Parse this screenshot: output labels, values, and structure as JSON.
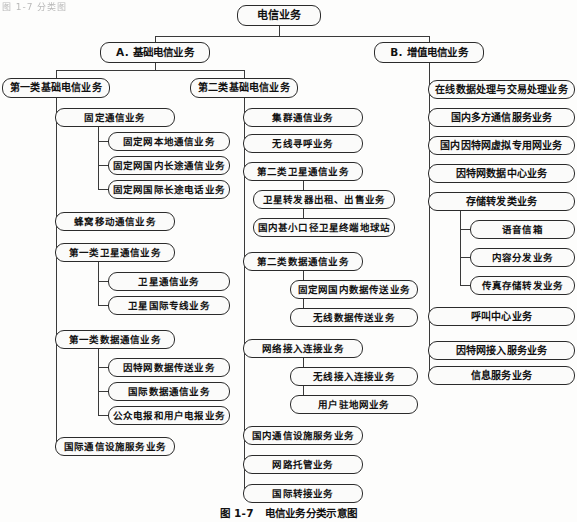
{
  "figure": {
    "caption_number": "图 1-7",
    "caption_title": "电信业务分类示意图",
    "top_cut_text": "图 1-7  分类图",
    "line_color": "#3a3a3a",
    "box_border_color": "#2b2b2b",
    "box_fill_color": "#fbfbfa",
    "text_color": "#111111"
  },
  "nodes": {
    "root": {
      "label": "电信业务",
      "x": 237,
      "y": 5,
      "w": 84,
      "h": 21,
      "level": 0
    },
    "a_basic": {
      "label": "A. 基础电信业务",
      "x": 100,
      "y": 42,
      "w": 110,
      "h": 21,
      "level": 1
    },
    "b_value": {
      "label": "B. 增值电信业务",
      "x": 374,
      "y": 42,
      "w": 110,
      "h": 21,
      "level": 1
    },
    "a1": {
      "label": "第一类基础电信业务",
      "x": 2,
      "y": 78,
      "w": 108,
      "h": 20,
      "level": 2
    },
    "a2": {
      "label": "第二类基础电信业务",
      "x": 190,
      "y": 78,
      "w": 108,
      "h": 20,
      "level": 2
    },
    "a1_1": {
      "label": "固定通信业务",
      "x": 55,
      "y": 108,
      "w": 120,
      "h": 19,
      "level": 3
    },
    "a1_1_1": {
      "label": "固定网本地通信业务",
      "x": 108,
      "y": 132,
      "w": 122,
      "h": 19,
      "level": 4
    },
    "a1_1_2": {
      "label": "固定网国内长途通信业务",
      "x": 108,
      "y": 156,
      "w": 122,
      "h": 19,
      "level": 4
    },
    "a1_1_3": {
      "label": "固定网国际长途电话业务",
      "x": 108,
      "y": 180,
      "w": 122,
      "h": 19,
      "level": 4
    },
    "a1_2": {
      "label": "蜂窝移动通信业务",
      "x": 55,
      "y": 212,
      "w": 120,
      "h": 19,
      "level": 3
    },
    "a1_3": {
      "label": "第一类卫星通信业务",
      "x": 55,
      "y": 243,
      "w": 120,
      "h": 19,
      "level": 3
    },
    "a1_3_1": {
      "label": "卫星通信业务",
      "x": 108,
      "y": 272,
      "w": 122,
      "h": 19,
      "level": 4
    },
    "a1_3_2": {
      "label": "卫星国际专线业务",
      "x": 108,
      "y": 296,
      "w": 122,
      "h": 19,
      "level": 4
    },
    "a1_4": {
      "label": "第一类数据通信业务",
      "x": 55,
      "y": 330,
      "w": 120,
      "h": 19,
      "level": 3
    },
    "a1_4_1": {
      "label": "因特网数据传送业务",
      "x": 108,
      "y": 358,
      "w": 122,
      "h": 19,
      "level": 4
    },
    "a1_4_2": {
      "label": "国际数据通信业务",
      "x": 108,
      "y": 382,
      "w": 122,
      "h": 19,
      "level": 4
    },
    "a1_4_3": {
      "label": "公众电报和用户电报业务",
      "x": 108,
      "y": 406,
      "w": 122,
      "h": 19,
      "level": 4
    },
    "a1_5": {
      "label": "国际通信设施服务业务",
      "x": 55,
      "y": 437,
      "w": 120,
      "h": 19,
      "level": 3
    },
    "a2_1": {
      "label": "集群通信业务",
      "x": 243,
      "y": 108,
      "w": 120,
      "h": 19,
      "level": 3
    },
    "a2_2": {
      "label": "无线寻呼业务",
      "x": 243,
      "y": 134,
      "w": 120,
      "h": 19,
      "level": 3
    },
    "a2_3": {
      "label": "第二类卫星通信业务",
      "x": 243,
      "y": 162,
      "w": 120,
      "h": 19,
      "level": 3
    },
    "a2_3_1": {
      "label": "卫星转发器出租、出售业务",
      "x": 253,
      "y": 190,
      "w": 142,
      "h": 19,
      "level": 4
    },
    "a2_3_2": {
      "label": "国内甚小口径卫星终端地球站",
      "x": 253,
      "y": 218,
      "w": 142,
      "h": 19,
      "level": 4
    },
    "a2_4": {
      "label": "第二类数据通信业务",
      "x": 243,
      "y": 252,
      "w": 120,
      "h": 19,
      "level": 3
    },
    "a2_4_1": {
      "label": "固定网国内数据传送业务",
      "x": 290,
      "y": 280,
      "w": 128,
      "h": 19,
      "level": 4
    },
    "a2_4_2": {
      "label": "无线数据传送业务",
      "x": 290,
      "y": 308,
      "w": 128,
      "h": 19,
      "level": 4
    },
    "a2_5": {
      "label": "网络接入连接业务",
      "x": 243,
      "y": 339,
      "w": 120,
      "h": 19,
      "level": 3
    },
    "a2_5_1": {
      "label": "无线接入连接业务",
      "x": 290,
      "y": 367,
      "w": 128,
      "h": 19,
      "level": 4
    },
    "a2_5_2": {
      "label": "用户驻地网业务",
      "x": 290,
      "y": 395,
      "w": 128,
      "h": 19,
      "level": 4
    },
    "a2_6": {
      "label": "国内通信设施服务业务",
      "x": 243,
      "y": 426,
      "w": 120,
      "h": 19,
      "level": 3
    },
    "a2_7": {
      "label": "网路托管业务",
      "x": 243,
      "y": 455,
      "w": 120,
      "h": 19,
      "level": 3
    },
    "a2_8": {
      "label": "国际转接业务",
      "x": 243,
      "y": 484,
      "w": 120,
      "h": 19,
      "level": 3
    },
    "b1": {
      "label": "在线数据处理与交易处理业务",
      "x": 428,
      "y": 80,
      "w": 147,
      "h": 19,
      "level": 2
    },
    "b2": {
      "label": "国内多方通信服务业务",
      "x": 428,
      "y": 108,
      "w": 147,
      "h": 19,
      "level": 2
    },
    "b3": {
      "label": "国内因特网虚拟专用网业务",
      "x": 428,
      "y": 136,
      "w": 147,
      "h": 19,
      "level": 2
    },
    "b4": {
      "label": "因特网数据中心业务",
      "x": 428,
      "y": 164,
      "w": 147,
      "h": 19,
      "level": 2
    },
    "b5": {
      "label": "存储转发类业务",
      "x": 428,
      "y": 192,
      "w": 147,
      "h": 19,
      "level": 2
    },
    "b5_1": {
      "label": "语音信箱",
      "x": 470,
      "y": 220,
      "w": 105,
      "h": 19,
      "level": 4
    },
    "b5_2": {
      "label": "内容分发业务",
      "x": 470,
      "y": 248,
      "w": 105,
      "h": 19,
      "level": 4
    },
    "b5_3": {
      "label": "传真存储转发业务",
      "x": 470,
      "y": 276,
      "w": 105,
      "h": 19,
      "level": 4
    },
    "b6": {
      "label": "呼叫中心业务",
      "x": 428,
      "y": 307,
      "w": 147,
      "h": 19,
      "level": 2
    },
    "b7": {
      "label": "因特网接入服务业务",
      "x": 428,
      "y": 341,
      "w": 147,
      "h": 19,
      "level": 2
    },
    "b8": {
      "label": "信息服务业务",
      "x": 428,
      "y": 366,
      "w": 147,
      "h": 19,
      "level": 2
    }
  },
  "connectors": [
    "M279,26 L279,36",
    "M155,36 L429,36",
    "M155,36 L155,42",
    "M429,36 L429,42",
    "M155,63 L155,70",
    "M56,70 L244,70",
    "M56,70 L56,78",
    "M244,70 L244,78",
    "M56,98 L56,447",
    "M56,117.5 L55,117.5",
    "M56,221.5 L55,221.5",
    "M56,252.5 L55,252.5",
    "M56,339.5 L55,339.5",
    "M56,447 L55,447",
    "M98,127 L98,190",
    "M98,141.5 L108,141.5",
    "M98,165.5 L108,165.5",
    "M98,189.5 L108,189.5",
    "M98,262 L98,306",
    "M98,281.5 L108,281.5",
    "M98,305.5 L108,305.5",
    "M98,349 L98,416",
    "M98,367.5 L108,367.5",
    "M98,391.5 L108,391.5",
    "M98,415.5 L108,415.5",
    "M244,98 L244,494",
    "M244,117.5 L243,117.5",
    "M244,143.5 L243,143.5",
    "M244,171.5 L243,171.5",
    "M244,261.5 L243,261.5",
    "M244,348.5 L243,348.5",
    "M244,435.5 L243,435.5",
    "M244,464.5 L243,464.5",
    "M244,493.5 L243,493.5",
    "M303,181 L303,228",
    "M303,199.5 L253,199.5",
    "M303,227.5 L253,227.5",
    "M303,271 L303,318",
    "M303,289.5 L290,289.5",
    "M303,317.5 L290,317.5",
    "M303,358 L303,405",
    "M303,376.5 L290,376.5",
    "M303,404.5 L290,404.5",
    "M429,63 L429,376",
    "M429,89.5 L428,89.5",
    "M429,117.5 L428,117.5",
    "M429,145.5 L428,145.5",
    "M429,173.5 L428,173.5",
    "M429,201.5 L428,201.5",
    "M429,316.5 L428,316.5",
    "M429,350.5 L428,350.5",
    "M429,375.5 L428,375.5",
    "M460,211 L460,286",
    "M460,229.5 L470,229.5",
    "M460,257.5 L470,257.5",
    "M460,285.5 L470,285.5"
  ]
}
